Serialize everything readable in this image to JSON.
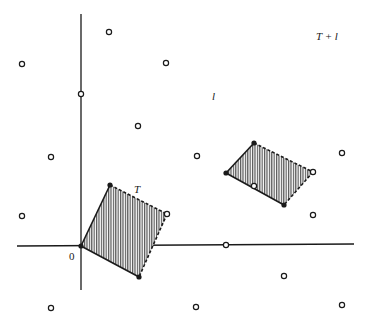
{
  "diagram": {
    "colors": {
      "ink": "#1a1a1a",
      "hatch": "#555555",
      "background": "#ffffff"
    },
    "axes": {
      "origin": [
        81,
        246
      ],
      "x_axis": {
        "from": [
          17,
          246
        ],
        "to": [
          354,
          244
        ]
      },
      "y_axis": {
        "from": [
          81,
          14
        ],
        "to": [
          81,
          290
        ]
      }
    },
    "lattice_points": [
      [
        109,
        32
      ],
      [
        22,
        64
      ],
      [
        166,
        63
      ],
      [
        81,
        94
      ],
      [
        138,
        126
      ],
      [
        51,
        157
      ],
      [
        197,
        156
      ],
      [
        342,
        153
      ],
      [
        254,
        186
      ],
      [
        22,
        216
      ],
      [
        313,
        215
      ],
      [
        226,
        245
      ],
      [
        284,
        276
      ],
      [
        51,
        308
      ],
      [
        196,
        307
      ],
      [
        342,
        305
      ]
    ],
    "regions": [
      {
        "name": "T",
        "vertices": [
          [
            81,
            246
          ],
          [
            110,
            185
          ],
          [
            167,
            214
          ],
          [
            139,
            277
          ]
        ],
        "solid_vertices": [
          [
            81,
            246
          ],
          [
            110,
            185
          ],
          [
            139,
            277
          ]
        ],
        "open_vertices": [
          [
            167,
            214
          ]
        ]
      },
      {
        "name": "T + l",
        "vertices": [
          [
            226,
            173
          ],
          [
            254,
            143
          ],
          [
            313,
            172
          ],
          [
            284,
            205
          ]
        ],
        "solid_vertices": [
          [
            226,
            173
          ],
          [
            254,
            143
          ],
          [
            284,
            205
          ]
        ],
        "open_vertices": [
          [
            313,
            172
          ]
        ]
      }
    ],
    "labels": {
      "origin": "0",
      "T": "T",
      "T_plus_l": "T + l",
      "l": "l"
    }
  }
}
